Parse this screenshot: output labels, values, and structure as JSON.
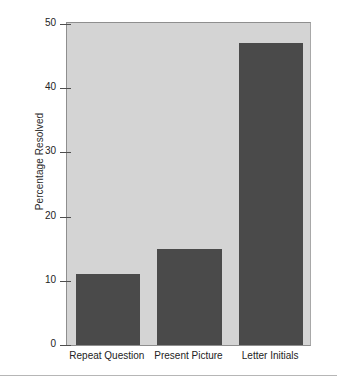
{
  "chart_data": {
    "type": "bar",
    "title": "",
    "subtitle": "",
    "xlabel": "",
    "ylabel": "Percentage Resolved",
    "categories": [
      "Repeat Question",
      "Present Picture",
      "Letter Initials"
    ],
    "values": [
      11,
      15,
      47
    ],
    "ylim": [
      0,
      50
    ],
    "yticks": [
      0,
      10,
      20,
      30,
      40,
      50
    ],
    "ytick_labels": [
      "0",
      "10",
      "20",
      "30",
      "40",
      "50"
    ],
    "grid": false,
    "legend": null,
    "legend_position": "none",
    "annotations": [],
    "colors": {
      "bar": "#4a4a4a",
      "plot_background": "#d4d4d4",
      "page_background": "#ffffff",
      "axis": "#4e4e4e",
      "text": "#232323",
      "rule": "#b6b6b6"
    }
  },
  "figure": {
    "bottom_rule_visible": true
  }
}
